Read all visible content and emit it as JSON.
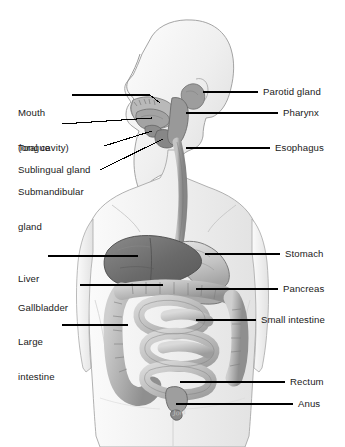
{
  "diagram": {
    "background_color": "#ffffff",
    "line_color": "#000000",
    "text_color": "#1a1a1a",
    "artist_signature": "Joni"
  },
  "labels_left": [
    {
      "id": "mouth",
      "name": "Mouth\n(oral cavity)",
      "line1": "Mouth",
      "line2": "(oral cavity)",
      "x": 18,
      "y": 84
    },
    {
      "id": "tongue",
      "name": "Tongue",
      "line1": "Tongue",
      "line2": "",
      "x": 18,
      "y": 120
    },
    {
      "id": "sublingual",
      "name": "Sublingual gland",
      "line1": "Sublingual gland",
      "line2": "",
      "x": 18,
      "y": 142
    },
    {
      "id": "submandibular",
      "name": "Submandibular\ngland",
      "line1": "Submandibular",
      "line2": "gland",
      "x": 18,
      "y": 163
    },
    {
      "id": "liver",
      "name": "Liver",
      "line1": "Liver",
      "line2": "",
      "x": 18,
      "y": 251
    },
    {
      "id": "gallbladder",
      "name": "Gallbladder",
      "line1": "Gallbladder",
      "line2": "",
      "x": 18,
      "y": 280
    },
    {
      "id": "large-intestine",
      "name": "Large\nintestine",
      "line1": "Large",
      "line2": "intestine",
      "x": 18,
      "y": 313
    }
  ],
  "labels_right": [
    {
      "id": "parotid",
      "name": "Parotid gland",
      "x": 263,
      "y": 86
    },
    {
      "id": "pharynx",
      "name": "Pharynx",
      "x": 283,
      "y": 108
    },
    {
      "id": "esophagus",
      "name": "Esophagus",
      "x": 275,
      "y": 143
    },
    {
      "id": "stomach",
      "name": "Stomach",
      "x": 285,
      "y": 249
    },
    {
      "id": "pancreas",
      "name": "Pancreas",
      "x": 283,
      "y": 284
    },
    {
      "id": "small-intestine",
      "name": "Small intestine",
      "x": 261,
      "y": 315
    },
    {
      "id": "rectum",
      "name": "Rectum",
      "x": 290,
      "y": 377
    },
    {
      "id": "anus",
      "name": "Anus",
      "x": 298,
      "y": 399
    }
  ],
  "organs": [
    {
      "id": "parotid-gland",
      "name": "parotid gland",
      "color": "#9a9a9a"
    },
    {
      "id": "oral-cavity",
      "name": "oral cavity",
      "color": "#b4b4b4"
    },
    {
      "id": "tongue",
      "name": "tongue",
      "color": "#a8a8a8"
    },
    {
      "id": "sublingual-gland",
      "name": "sublingual gland",
      "color": "#8e8e8e"
    },
    {
      "id": "submandibular-gland",
      "name": "submandibular gland",
      "color": "#8a8a8a"
    },
    {
      "id": "pharynx",
      "name": "pharynx",
      "color": "#989898"
    },
    {
      "id": "esophagus",
      "name": "esophagus",
      "color": "#a2a2a2"
    },
    {
      "id": "stomach",
      "name": "stomach",
      "color": "#bdbdbd"
    },
    {
      "id": "liver",
      "name": "liver",
      "color": "#6e6e6e"
    },
    {
      "id": "gallbladder",
      "name": "gallbladder",
      "color": "#d8d8d8"
    },
    {
      "id": "pancreas",
      "name": "pancreas",
      "color": "#a6a6a6"
    },
    {
      "id": "small-intestine",
      "name": "small intestine",
      "color": "#c6c6c6"
    },
    {
      "id": "large-intestine",
      "name": "large intestine",
      "color": "#b0b0b0"
    },
    {
      "id": "rectum",
      "name": "rectum",
      "color": "#9c9c9c"
    },
    {
      "id": "anus",
      "name": "anus",
      "color": "#8f8f8f"
    },
    {
      "id": "body-silhouette",
      "name": "body silhouette",
      "color": "#f2f2f2"
    }
  ]
}
